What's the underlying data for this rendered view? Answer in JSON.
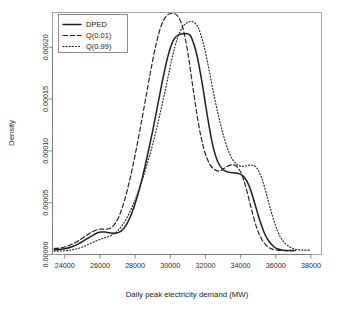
{
  "chart_data": {
    "type": "line",
    "title": "",
    "xlabel": "Daily peak electricity demand  (MW)",
    "ylabel": "Density",
    "xlim": [
      23300,
      38600
    ],
    "ylim": [
      0,
      0.0002335
    ],
    "grid": false,
    "legend_position": "top-left",
    "xticks": [
      24000,
      26000,
      28000,
      30000,
      32000,
      34000,
      36000,
      38000
    ],
    "xtick_labels": [
      "24000",
      "26000",
      "28000",
      "30000",
      "32000",
      "34000",
      "36000",
      "38000"
    ],
    "yticks": [
      0.0,
      5e-05,
      0.0001,
      0.00015,
      0.0002
    ],
    "ytick_labels": [
      "0.00000",
      "0.00005",
      "0.00010",
      "0.00015",
      "0.00020"
    ],
    "series": [
      {
        "name": "DPED",
        "style": "solid",
        "color": "#1f1f1f",
        "peak_x": 31000,
        "peak_y": 0.000213,
        "x": [
          23400,
          23700,
          24000,
          24400,
          24800,
          25200,
          25600,
          25900,
          26100,
          26300,
          26600,
          26900,
          27200,
          27500,
          27800,
          28100,
          28400,
          28700,
          29000,
          29300,
          29600,
          29900,
          30200,
          30500,
          30800,
          31000,
          31200,
          31500,
          31800,
          32100,
          32400,
          32700,
          33000,
          33300,
          33600,
          33900,
          34200,
          34500,
          34800,
          35100,
          35400,
          35700,
          36000,
          36400,
          36800,
          37100
        ],
        "y": [
          4.5e-06,
          4.8e-06,
          5.5e-06,
          7.5e-06,
          1.05e-05,
          1.45e-05,
          1.85e-05,
          2.12e-05,
          2.18e-05,
          2.16e-05,
          2.08e-05,
          2.05e-05,
          2.25e-05,
          2.85e-05,
          3.95e-05,
          5.45e-05,
          7.35e-05,
          9.55e-05,
          0.0001195,
          0.0001455,
          0.0001715,
          0.0001935,
          0.0002075,
          0.0002122,
          0.000213,
          0.0002128,
          0.0002095,
          0.0001935,
          0.0001665,
          0.0001345,
          0.0001065,
          8.95e-05,
          8.18e-05,
          7.95e-05,
          7.88e-05,
          7.8e-05,
          7.48e-05,
          6.55e-05,
          4.95e-05,
          3.25e-05,
          1.88e-05,
          1.08e-05,
          6.2e-06,
          4.2e-06,
          3.8e-06,
          3.8e-06
        ]
      },
      {
        "name": "Q(0.01)",
        "style": "dashed",
        "color": "#1f1f1f",
        "peak_x": 30400,
        "peak_y": 0.0002325,
        "x": [
          23400,
          23700,
          24000,
          24400,
          24800,
          25200,
          25600,
          25900,
          26200,
          26500,
          26800,
          27100,
          27400,
          27700,
          28000,
          28300,
          28600,
          28900,
          29200,
          29500,
          29800,
          30100,
          30400,
          30700,
          31000,
          31300,
          31600,
          31900,
          32200,
          32500,
          32800,
          33100,
          33400,
          33700,
          34000,
          34300,
          34600,
          34900,
          35200,
          35500,
          35800,
          36200,
          36600,
          37000
        ],
        "y": [
          5.8e-06,
          6.2e-06,
          7.2e-06,
          9.8e-06,
          1.35e-05,
          1.82e-05,
          2.22e-05,
          2.42e-05,
          2.45e-05,
          2.48e-05,
          2.85e-05,
          3.75e-05,
          5.25e-05,
          7.25e-05,
          9.62e-05,
          0.0001225,
          0.0001505,
          0.0001785,
          0.0002035,
          0.0002215,
          0.0002305,
          0.0002325,
          0.0002305,
          0.0002195,
          0.0001945,
          0.0001595,
          0.0001265,
          0.0001025,
          8.85e-05,
          8.22e-05,
          8.05e-05,
          8.35e-05,
          8.62e-05,
          8.58e-05,
          7.95e-05,
          6.48e-05,
          4.48e-05,
          2.65e-05,
          1.48e-05,
          8.2e-06,
          5.2e-06,
          4e-06,
          3.8e-06,
          3.8e-06
        ]
      },
      {
        "name": "Q(0.99)",
        "style": "dotted",
        "color": "#1f1f1f",
        "peak_x": 31300,
        "peak_y": 0.0002245,
        "x": [
          23400,
          23800,
          24200,
          24600,
          25000,
          25400,
          25800,
          26200,
          26600,
          27000,
          27400,
          27800,
          28200,
          28600,
          29000,
          29400,
          29800,
          30100,
          30400,
          30700,
          31000,
          31300,
          31600,
          31900,
          32200,
          32500,
          32800,
          33100,
          33400,
          33700,
          34000,
          34300,
          34600,
          34900,
          35200,
          35500,
          35800,
          36100,
          36400,
          36800,
          37200,
          37600,
          38000
        ],
        "y": [
          3.2e-06,
          3.4e-06,
          4e-06,
          5.2e-06,
          7.2e-06,
          1.02e-05,
          1.32e-05,
          1.58e-05,
          1.82e-05,
          2.28e-05,
          3.15e-05,
          4.48e-05,
          6.18e-05,
          8.25e-05,
          0.0001065,
          0.0001345,
          0.0001655,
          0.0001895,
          0.0002085,
          0.0002195,
          0.000224,
          0.0002245,
          0.0002185,
          0.0002025,
          0.0001785,
          0.0001525,
          0.0001295,
          0.0001105,
          9.62e-05,
          8.82e-05,
          8.52e-05,
          8.55e-05,
          8.62e-05,
          8.38e-05,
          7.38e-05,
          5.62e-05,
          3.78e-05,
          2.28e-05,
          1.32e-05,
          7.2e-06,
          4.8e-06,
          4.2e-06,
          4.2e-06
        ]
      }
    ]
  },
  "legend": {
    "entries": [
      {
        "label": "DPED",
        "style": "solid"
      },
      {
        "label": "Q(0.01)",
        "style": "dashed"
      },
      {
        "label": "Q(0.99)",
        "style": "dotted"
      }
    ]
  }
}
